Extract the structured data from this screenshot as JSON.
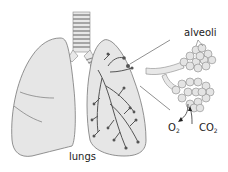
{
  "diagram": {
    "labels": {
      "lungs": "lungs",
      "alveoli": "alveoli",
      "o2_main": "O",
      "o2_sub": "2",
      "co2_main": "CO",
      "co2_sub": "2"
    },
    "colors": {
      "lung_fill": "#e6e6e6",
      "outline": "#777777",
      "airway": "#555555",
      "alveolus_fill": "#dcdcdc"
    }
  }
}
